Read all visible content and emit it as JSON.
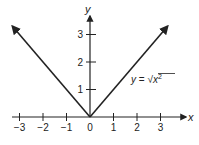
{
  "chart_data": {
    "type": "line",
    "title": "",
    "xlabel": "x",
    "ylabel": "y",
    "xlim": [
      -3.3,
      4
    ],
    "ylim": [
      0,
      3.7
    ],
    "x_ticks": [
      -3,
      -2,
      -1,
      0,
      1,
      2,
      3
    ],
    "x_tick_labels": [
      "−3",
      "−2",
      "−1",
      "0",
      "1",
      "2",
      "3"
    ],
    "y_ticks": [
      1,
      2,
      3
    ],
    "y_tick_labels": [
      "1",
      "2",
      "3"
    ],
    "grid": false,
    "series": [
      {
        "name": "y = √(x²)",
        "x": [
          -3.3,
          0,
          3.3
        ],
        "y": [
          3.3,
          0,
          3.3
        ],
        "arrows_at_ends": true
      }
    ],
    "annotations": [
      {
        "text_lhs": "y",
        "text_mid": " = ",
        "text_rad": "x",
        "text_sup": "2",
        "near_x": 2.2,
        "near_y": 1.2
      }
    ]
  }
}
